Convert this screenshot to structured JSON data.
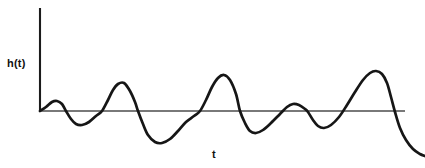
{
  "figure": {
    "background_color": "#ffffff",
    "curve_color": "#161616",
    "axis_color": "#4d4d4d",
    "vertical_axis_color": "#1c1c1c"
  },
  "labels": {
    "y_axis": "h(t)",
    "x_axis": "t"
  },
  "chart_data": {
    "type": "line",
    "title": "",
    "subtitle": "",
    "xlabel": "t",
    "ylabel": "h(t)",
    "legend": [],
    "grid": false,
    "xlim": [
      0,
      425
    ],
    "ylim": [
      168,
      0
    ],
    "annotations": [],
    "axes": {
      "vertical_axis": {
        "x": 40,
        "y_top": 8,
        "y_bottom": 111
      },
      "horizontal_axis": {
        "y": 111,
        "x_left": 40,
        "x_right": 405
      }
    },
    "zero_level_y": 111,
    "series": [
      {
        "name": "h(t)",
        "color": "#161616",
        "points": [
          [
            40,
            111
          ],
          [
            46,
            107
          ],
          [
            52,
            102
          ],
          [
            57,
            101
          ],
          [
            62,
            104
          ],
          [
            66,
            111
          ],
          [
            71,
            119
          ],
          [
            76,
            124
          ],
          [
            82,
            125
          ],
          [
            89,
            122
          ],
          [
            96,
            116
          ],
          [
            102,
            111
          ],
          [
            108,
            100
          ],
          [
            113,
            90
          ],
          [
            118,
            84
          ],
          [
            124,
            83
          ],
          [
            130,
            91
          ],
          [
            135,
            102
          ],
          [
            138,
            111
          ],
          [
            143,
            124
          ],
          [
            148,
            135
          ],
          [
            155,
            142
          ],
          [
            162,
            143
          ],
          [
            170,
            139
          ],
          [
            178,
            131
          ],
          [
            186,
            122
          ],
          [
            194,
            116
          ],
          [
            200,
            111
          ],
          [
            206,
            100
          ],
          [
            212,
            87
          ],
          [
            218,
            78
          ],
          [
            224,
            75
          ],
          [
            230,
            80
          ],
          [
            236,
            94
          ],
          [
            240,
            111
          ],
          [
            245,
            123
          ],
          [
            250,
            131
          ],
          [
            256,
            133
          ],
          [
            263,
            130
          ],
          [
            271,
            123
          ],
          [
            280,
            114
          ],
          [
            287,
            107
          ],
          [
            293,
            104
          ],
          [
            299,
            105
          ],
          [
            305,
            109
          ],
          [
            308,
            112
          ],
          [
            313,
            120
          ],
          [
            318,
            126
          ],
          [
            324,
            128
          ],
          [
            331,
            125
          ],
          [
            339,
            117
          ],
          [
            347,
            105
          ],
          [
            355,
            92
          ],
          [
            363,
            80
          ],
          [
            370,
            73
          ],
          [
            376,
            71
          ],
          [
            382,
            74
          ],
          [
            387,
            83
          ],
          [
            391,
            97
          ],
          [
            395,
            112
          ],
          [
            400,
            128
          ],
          [
            406,
            140
          ],
          [
            413,
            149
          ],
          [
            420,
            154
          ],
          [
            425,
            156
          ]
        ]
      }
    ],
    "key_features": {
      "peaks": [
        {
          "x": 57,
          "y": 101,
          "amplitude_px": 10
        },
        {
          "x": 121,
          "y": 83,
          "amplitude_px": 28
        },
        {
          "x": 221,
          "y": 75,
          "amplitude_px": 36
        },
        {
          "x": 295,
          "y": 104,
          "amplitude_px": 7
        },
        {
          "x": 377,
          "y": 71,
          "amplitude_px": 40
        }
      ],
      "troughs": [
        {
          "x": 79,
          "y": 125,
          "amplitude_px": -14
        },
        {
          "x": 158,
          "y": 143,
          "amplitude_px": -32
        },
        {
          "x": 256,
          "y": 133,
          "amplitude_px": -22
        },
        {
          "x": 323,
          "y": 128,
          "amplitude_px": -17
        }
      ],
      "zero_crossings": [
        40,
        66,
        102,
        138,
        200,
        240,
        288,
        307,
        341,
        394
      ]
    }
  }
}
